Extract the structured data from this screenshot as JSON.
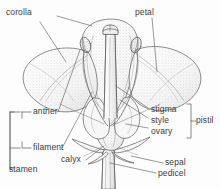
{
  "figure": {
    "kind": "botanical-diagram",
    "style": "pen-and-ink stippled line drawing",
    "background_color": "#fdfdfd",
    "ink_color": "#5a5a5a",
    "label_color": "#3b3b3b",
    "leader_color": "#6b6b6b"
  },
  "labels": {
    "corolla": "corolla",
    "petal": "petal",
    "anther": "anther",
    "filament": "filament",
    "stamen": "stamen",
    "stigma": "stigma",
    "style": "style",
    "ovary": "ovary",
    "pistil": "pistil",
    "calyx": "calyx",
    "sepal": "sepal",
    "pedicel": "pedicel"
  },
  "groups": {
    "stamen_parts": [
      "anther",
      "filament"
    ],
    "pistil_parts": [
      "stigma",
      "style",
      "ovary"
    ]
  }
}
